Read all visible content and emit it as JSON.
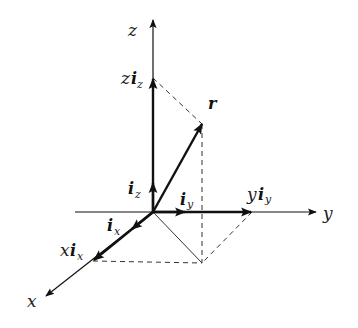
{
  "diagram": {
    "origin": [
      153,
      212
    ],
    "axes": {
      "z": {
        "label": "z",
        "tip": [
          153,
          20
        ]
      },
      "y": {
        "label": "y",
        "start": [
          75,
          212
        ],
        "tip": [
          316,
          212
        ]
      },
      "x": {
        "label": "x",
        "tip": [
          46,
          296
        ]
      }
    },
    "unit_vectors": {
      "iz": {
        "base": "i",
        "sub": "z"
      },
      "iy": {
        "base": "i",
        "sub": "y"
      },
      "ix": {
        "base": "i",
        "sub": "x"
      }
    },
    "components": {
      "z_iz": {
        "coef": "z",
        "base": "i",
        "sub": "z",
        "point": [
          153,
          78
        ]
      },
      "y_iy": {
        "coef": "y",
        "base": "i",
        "sub": "y",
        "point": [
          252,
          212
        ]
      },
      "x_ix": {
        "coef": "x",
        "base": "i",
        "sub": "x",
        "point": [
          93,
          261
        ]
      }
    },
    "vector_r": {
      "label": "r",
      "tip": [
        202,
        124
      ]
    },
    "projection_point": [
      202,
      263
    ]
  }
}
